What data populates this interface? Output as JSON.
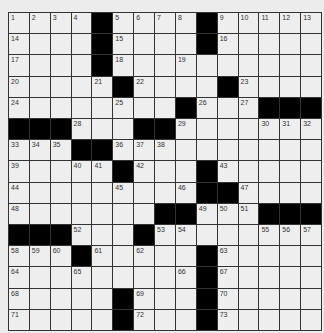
{
  "puzzle": {
    "rows": 15,
    "cols": 15,
    "grid": [
      [
        "1",
        "2",
        "3",
        "4",
        "#",
        "5",
        "6",
        "7",
        "8",
        "#",
        "9",
        "10",
        "11",
        "12",
        "13"
      ],
      [
        "14",
        "",
        "",
        "",
        "#",
        "15",
        "",
        "",
        "",
        "#",
        "16",
        "",
        "",
        "",
        ""
      ],
      [
        "17",
        "",
        "",
        "",
        "#",
        "18",
        "",
        "",
        "19",
        "",
        "",
        "",
        "",
        "",
        ""
      ],
      [
        "20",
        "",
        "",
        "",
        "21",
        "#",
        "22",
        "",
        "",
        "",
        "#",
        "23",
        "",
        "",
        ""
      ],
      [
        "24",
        "",
        "",
        "",
        "",
        "25",
        "",
        "",
        "#",
        "26",
        "",
        "27",
        "#",
        "#",
        "#"
      ],
      [
        "#",
        "#",
        "#",
        "28",
        "",
        "",
        "#",
        "#",
        "29",
        "",
        "",
        "",
        "30",
        "31",
        "32"
      ],
      [
        "33",
        "34",
        "35",
        "#",
        "#",
        "36",
        "37",
        "38",
        "",
        "",
        "",
        "",
        "",
        "",
        ""
      ],
      [
        "39",
        "",
        "",
        "40",
        "41",
        "#",
        "42",
        "",
        "",
        "#",
        "43",
        "",
        "",
        "",
        ""
      ],
      [
        "44",
        "",
        "",
        "",
        "",
        "45",
        "",
        "",
        "46",
        "#",
        "#",
        "47",
        "",
        "",
        ""
      ],
      [
        "48",
        "",
        "",
        "",
        "",
        "",
        "",
        "#",
        "#",
        "49",
        "50",
        "51",
        "#",
        "#",
        "#"
      ],
      [
        "#",
        "#",
        "#",
        "52",
        "",
        "",
        "#",
        "53",
        "54",
        "",
        "",
        "",
        "55",
        "56",
        "57"
      ],
      [
        "58",
        "59",
        "60",
        "#",
        "61",
        "",
        "62",
        "",
        "",
        "#",
        "63",
        "",
        "",
        "",
        ""
      ],
      [
        "64",
        "",
        "",
        "65",
        "",
        "",
        "",
        "",
        "66",
        "#",
        "67",
        "",
        "",
        "",
        ""
      ],
      [
        "68",
        "",
        "",
        "",
        "",
        "#",
        "69",
        "",
        "",
        "#",
        "70",
        "",
        "",
        "",
        ""
      ],
      [
        "71",
        "",
        "",
        "",
        "",
        "#",
        "72",
        "",
        "",
        "#",
        "73",
        "",
        "",
        "",
        ""
      ]
    ]
  }
}
